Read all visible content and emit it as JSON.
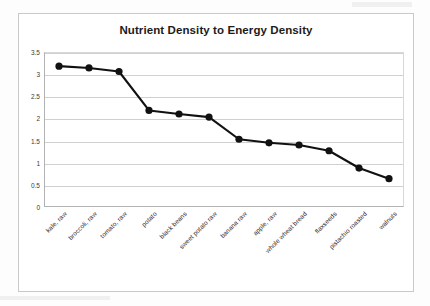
{
  "chart_data": {
    "type": "line",
    "title": "Nutrient Density to Energy Density",
    "xlabel": "",
    "ylabel": "",
    "ylim": [
      0,
      3.5
    ],
    "yticks": [
      "0",
      "0.5",
      "1",
      "1.5",
      "2",
      "2.5",
      "3",
      "3.5"
    ],
    "ytick_values": [
      0,
      0.5,
      1,
      1.5,
      2,
      2.5,
      3,
      3.5
    ],
    "grid": true,
    "legend": "none",
    "marker": "filled-circle",
    "line_color": "#111111",
    "marker_color": "#111111",
    "categories": [
      "kale, raw",
      "broccoli, raw",
      "tomato, raw",
      "potato",
      "black beans",
      "sweet potato raw",
      "banana raw",
      "apple, raw",
      "whole wheat bread",
      "flaxseeds",
      "pistachio roasted",
      "walnuts"
    ],
    "values": [
      3.18,
      3.14,
      3.06,
      2.18,
      2.1,
      2.03,
      1.53,
      1.45,
      1.4,
      1.27,
      0.88,
      0.64
    ]
  },
  "colors": {
    "series": "#111111",
    "grid": "#d0d0d0",
    "axis": "#b2b2b2",
    "title_text": "#1b1b1b",
    "tick_text": "#3a3a3a",
    "frame": "#c9c9c9",
    "background": "#ffffff"
  }
}
